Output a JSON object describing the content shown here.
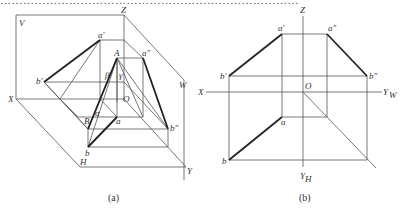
{
  "top_text": "……………………………………………………………………",
  "figure_a": {
    "caption": "(a)",
    "labels": {
      "V": "V",
      "Z": "Z",
      "W": "W",
      "X": "X",
      "H": "H",
      "Y": "Y",
      "a_prime": "a′",
      "a_dprime": "a″",
      "b_prime": "b′",
      "b_dprime": "b″",
      "A": "A",
      "B": "B",
      "a": "a",
      "b": "b",
      "O": "O",
      "alpha": "α",
      "beta": "β",
      "gamma": "γ"
    }
  },
  "figure_b": {
    "caption": "(b)",
    "labels": {
      "Z": "Z",
      "X": "X",
      "O": "O",
      "Y_W": "Y",
      "Y_W_sub": "W",
      "Y_H": "Y",
      "Y_H_sub": "H",
      "a_prime": "a′",
      "a_dprime": "a″",
      "b_prime": "b′",
      "b_dprime": "b″",
      "a": "a",
      "b": "b"
    }
  }
}
